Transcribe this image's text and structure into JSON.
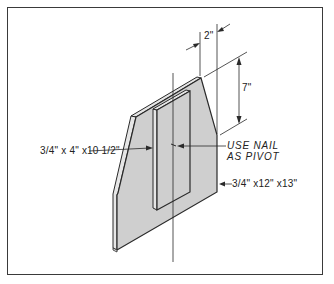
{
  "figure": {
    "type": "isometric technical drawing",
    "colors": {
      "face_fill": "#cfcfcf",
      "edge_fill": "#e6e6e6",
      "line": "#2a2a2a",
      "frame": "#3a3a3a",
      "background": "#ffffff"
    }
  },
  "labels": {
    "strip_size": "3/4\" x 4\" x10 1/2\"",
    "nail_note_line1": "USE NAIL",
    "nail_note_line2": "AS PIVOT",
    "board_size": "3/4\" x12\" x13\"",
    "dim_width": "2\"",
    "dim_height": "7\""
  },
  "caption": ""
}
